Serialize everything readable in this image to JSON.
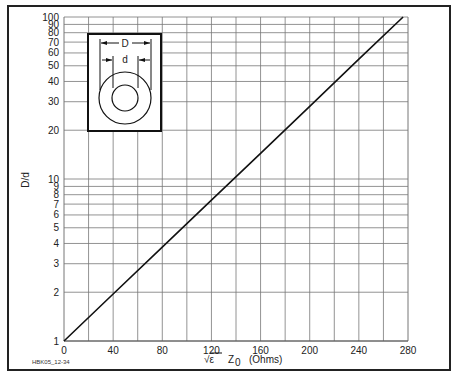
{
  "chart_data": {
    "type": "line",
    "title": "",
    "xlabel": "√ε Z0 (Ohms)",
    "ylabel": "D/d",
    "xlim": [
      0,
      280
    ],
    "ylim": [
      1,
      100
    ],
    "yscale": "log",
    "grid": true,
    "x_ticks": [
      "0",
      "40",
      "80",
      "120",
      "160",
      "200",
      "240",
      "280"
    ],
    "y_ticks": [
      "1",
      "2",
      "3",
      "4",
      "5",
      "6",
      "7",
      "8",
      "9",
      "10",
      "20",
      "30",
      "40",
      "50",
      "60",
      "70",
      "80",
      "90",
      "100"
    ],
    "series": [
      {
        "name": "D/d vs sqrt(e)*Z0",
        "x": [
          0,
          40,
          80,
          120,
          160,
          200,
          240,
          276
        ],
        "y": [
          1,
          1.95,
          3.8,
          7.4,
          14.4,
          28.1,
          54.9,
          100
        ]
      }
    ],
    "legend": null,
    "annotations": [
      "D",
      "d",
      "HBK05_12-34"
    ]
  },
  "axis": {
    "xlabel_sqrt": "√ε",
    "xlabel_z": "Z",
    "xlabel_sub": "0",
    "xlabel_unit": "(Ohms)",
    "ylabel": "D/d"
  },
  "inset": {
    "outer_label": "D",
    "inner_label": "d"
  },
  "figure_id": "HBK05_12-34"
}
